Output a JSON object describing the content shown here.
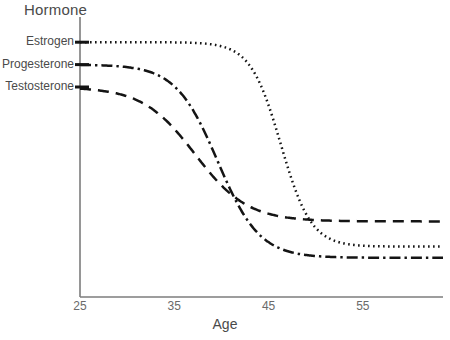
{
  "chart_data": {
    "type": "line",
    "title": "",
    "xlabel": "Age",
    "ylabel": "Hormone",
    "xlim": [
      25,
      63.5
    ],
    "ylim": [
      0,
      100
    ],
    "x_ticks": [
      25,
      35,
      45,
      55
    ],
    "x_tick_labels": [
      "25",
      "35",
      "45",
      "55"
    ],
    "y_ticks": [],
    "y_tick_labels": [],
    "grid": false,
    "legend_position": "left-axis-inline",
    "axis_color": "#7c7c7c",
    "line_color": "#141414",
    "background": "#ffffff",
    "x": [
      25,
      27,
      29,
      31,
      33,
      35,
      37,
      39,
      41,
      43,
      45,
      47,
      49,
      51,
      53,
      55,
      57,
      59,
      61,
      63.5
    ],
    "series": [
      {
        "name": "Estrogen",
        "dash_style": "dotted",
        "start_value": 91,
        "end_value": 18,
        "midpoint_age": 46.3,
        "steepness": 0.62,
        "values": [
          91,
          91,
          90.8,
          90.5,
          90.1,
          89.4,
          88.3,
          86.5,
          83.6,
          78.9,
          71.7,
          61.8,
          50.0,
          38.5,
          29.6,
          24.0,
          20.8,
          19.2,
          18.4,
          18.0
        ]
      },
      {
        "name": "Progesterone",
        "dash_style": "dash-dot",
        "start_value": 83,
        "end_value": 14,
        "midpoint_age": 39.6,
        "steepness": 0.45,
        "values": [
          83,
          82.4,
          81.3,
          79.6,
          76.8,
          72.7,
          66.9,
          59.6,
          51.2,
          42.7,
          35.0,
          28.6,
          23.7,
          20.3,
          17.9,
          16.4,
          15.4,
          14.8,
          14.4,
          14.1
        ]
      },
      {
        "name": "Testosterone",
        "dash_style": "dashed",
        "start_value": 75,
        "end_value": 27,
        "midpoint_age": 37.2,
        "steepness": 0.36,
        "values": [
          75,
          73.6,
          71.6,
          68.8,
          65.1,
          60.8,
          55.9,
          51.0,
          46.4,
          42.4,
          39.1,
          36.5,
          34.5,
          33.0,
          31.9,
          31.1,
          30.5,
          30.1,
          29.8,
          29.6
        ]
      }
    ],
    "annotations": []
  },
  "labels": {
    "y_axis_title": "Hormone",
    "x_axis_title": "Age"
  }
}
